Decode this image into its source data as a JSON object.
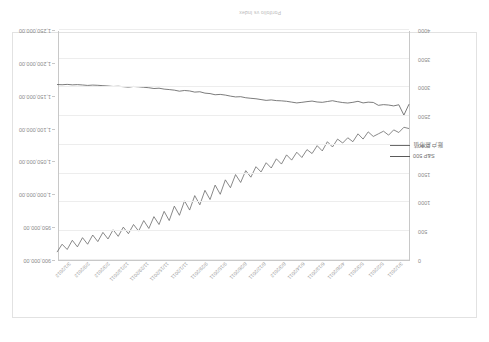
{
  "document": {
    "title": "Portfolio vs Index"
  },
  "chart_data": {
    "type": "line",
    "title": "",
    "xlabel": "",
    "ylabel": "",
    "grid": true,
    "legend_position": "left-middle",
    "orientation_note": "rendered-rotated-180",
    "x_tick_labels": [
      "3/1/2011",
      "5/2/2011",
      "5/3/2011",
      "4/28/2011",
      "6/13/2011",
      "6/14/2011",
      "8/3/2012",
      "8/12/2011",
      "8/26/2011",
      "9/15/2011",
      "9/29/2011",
      "11/1/2011",
      "11/15/2011",
      "11/29/2011",
      "12/13/2011",
      "2/3/2012",
      "2/9/2012",
      "3/1/2012"
    ],
    "left_axis": {
      "name": "S&P 500",
      "ticks": [
        "0",
        "500",
        "1000",
        "1500",
        "2000",
        "2500",
        "3000",
        "3500",
        "4000"
      ],
      "min": 0,
      "max": 4000,
      "inverted_display": true
    },
    "right_axis": {
      "name": "Portfolio Value",
      "ticks": [
        "900,000.00",
        "950,000.00",
        "1,000,000.00",
        "1,050,000.00",
        "1,100,000.00",
        "1,150,000.00",
        "1,200,000.00",
        "1,250,000.00"
      ],
      "min": 900000,
      "max": 1250000,
      "inverted_display": true
    },
    "series": [
      {
        "name": "S&P 500",
        "color": "#5a5a5a",
        "axis": "left",
        "values": [
          1290,
          1480,
          1300,
          1320,
          1305,
          1298,
          1310,
          1260,
          1255,
          1268,
          1240,
          1258,
          1270,
          1262,
          1248,
          1230,
          1244,
          1258,
          1252,
          1236,
          1246,
          1258,
          1268,
          1254,
          1240,
          1232,
          1228,
          1216,
          1224,
          1210,
          1196,
          1188,
          1178,
          1160,
          1164,
          1150,
          1132,
          1120,
          1126,
          1106,
          1098,
          1074,
          1080,
          1060,
          1052,
          1064,
          1046,
          1036,
          1028,
          1012,
          1018,
          1004,
          996,
          988,
          982,
          994,
          986,
          978,
          982,
          974,
          968,
          962,
          958,
          964,
          956,
          950,
          954,
          946,
          952,
          948
        ]
      },
      {
        "name": "Portfolio Value",
        "color": "#6b6b6b",
        "axis": "right",
        "values": [
          1050000,
          1048000,
          1056000,
          1052000,
          1060000,
          1054000,
          1058000,
          1062000,
          1055000,
          1066000,
          1058000,
          1070000,
          1064000,
          1072000,
          1066000,
          1078000,
          1070000,
          1084000,
          1076000,
          1088000,
          1082000,
          1094000,
          1086000,
          1098000,
          1090000,
          1104000,
          1096000,
          1110000,
          1102000,
          1116000,
          1108000,
          1124000,
          1114000,
          1132000,
          1120000,
          1140000,
          1128000,
          1150000,
          1136000,
          1158000,
          1144000,
          1166000,
          1152000,
          1174000,
          1160000,
          1182000,
          1168000,
          1190000,
          1176000,
          1196000,
          1184000,
          1202000,
          1190000,
          1206000,
          1196000,
          1210000,
          1200000,
          1214000,
          1204000,
          1218000,
          1208000,
          1222000,
          1212000,
          1226000,
          1216000,
          1230000,
          1220000,
          1234000,
          1226000,
          1238000
        ]
      }
    ]
  },
  "legend": {
    "items": [
      {
        "label": "S&P 500",
        "color": "#5a5a5a"
      },
      {
        "label": "账户总市值",
        "color": "#6b6b6b"
      }
    ]
  }
}
